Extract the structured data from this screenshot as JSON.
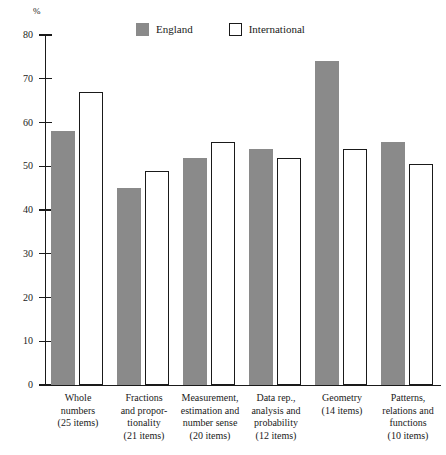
{
  "chart_data": {
    "type": "bar",
    "title": "",
    "subtitle": "",
    "xlabel": "",
    "ylabel": "%",
    "ylim": [
      0,
      80
    ],
    "ytick_values": [
      80,
      70,
      60,
      50,
      40,
      30,
      20,
      10,
      0
    ],
    "ytick_labels": [
      "80",
      "70",
      "60",
      "50",
      "40",
      "30",
      "20",
      "10",
      "0"
    ],
    "grid": false,
    "legend_position": "top-center",
    "categories": [
      "Whole numbers (25 items)",
      "Fractions and proportionality (21 items)",
      "Measurement, estimation and number sense (20 items)",
      "Data rep., analysis and probability (12 items)",
      "Geometry (14 items)",
      "Patterns, relations and functions (10 items)"
    ],
    "category_lines": [
      [
        "Whole",
        "numbers",
        "(25 items)"
      ],
      [
        "Fractions",
        "and propor-",
        "tionality",
        "(21 items)"
      ],
      [
        "Measurement,",
        "estimation and",
        "number sense",
        "(20 items)"
      ],
      [
        "Data rep.,",
        "analysis and",
        "probability",
        "(12 items)"
      ],
      [
        "Geometry",
        "(14 items)"
      ],
      [
        "Patterns,",
        "relations and",
        "functions",
        "(10 items)"
      ]
    ],
    "series": [
      {
        "name": "England",
        "color": "#8a8a8a",
        "values": [
          58,
          45,
          52,
          54,
          74,
          55.5
        ]
      },
      {
        "name": "International",
        "color": "#ffffff",
        "values": [
          67,
          49,
          55.5,
          52,
          54,
          50.5
        ]
      }
    ]
  },
  "legend": {
    "entries": [
      {
        "label": "England",
        "style": "filled"
      },
      {
        "label": "International",
        "style": "hollow"
      }
    ]
  },
  "axis": {
    "unit_label": "%"
  }
}
